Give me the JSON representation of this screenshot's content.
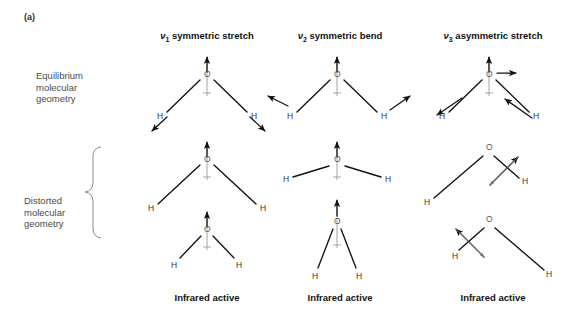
{
  "figure": {
    "panel_label": "(a)",
    "background_color": "#ffffff",
    "ink_color": "#111111",
    "axis_color": "#9a9a9a",
    "label_color": "#4a4a4a"
  },
  "columns": [
    {
      "id": "v1",
      "header_nu": "ν",
      "header_sub": "1",
      "header_rest": " symmetric stretch",
      "caption": "Infrared active",
      "center_x": 207
    },
    {
      "id": "v2",
      "header_nu": "ν",
      "header_sub": "2",
      "header_rest": " symmetric bend",
      "caption": "Infrared active",
      "center_x": 337
    },
    {
      "id": "v3",
      "header_nu": "ν",
      "header_sub": "3",
      "header_rest": " asymmetric stretch",
      "caption": "Infrared active",
      "center_x": 489
    }
  ],
  "row_labels": {
    "equilibrium": [
      "Equilibrium",
      "molecular",
      "geometry"
    ],
    "distorted": [
      "Distorted",
      "molecular",
      "geometry"
    ]
  },
  "atoms": {
    "oxygen": "O",
    "hydrogen": "H"
  },
  "diagram_data": {
    "type": "diagram",
    "subject": "Normal vibrational modes of the water molecule (H2O)",
    "rows": [
      "equilibrium molecular geometry",
      "distorted molecular geometry (extreme 1)",
      "distorted molecular geometry (extreme 2)"
    ],
    "modes": [
      {
        "label": "v1 symmetric stretch",
        "equilibrium_arrows": "O moves up along the C2 symmetry axis; both H atoms move outward and downward along their bonds",
        "distortion_1": "both O-H bonds stretched (long bonds, wide molecule)",
        "distortion_2": "both O-H bonds compressed (short bonds, small molecule)",
        "ir_activity": "Infrared active"
      },
      {
        "label": "v2 symmetric bend",
        "equilibrium_arrows": "O moves up along the symmetry axis; both H atoms move upward and outward perpendicular to the bonds",
        "distortion_1": "H-O-H bond angle opened wide (flattened molecule)",
        "distortion_2": "H-O-H bond angle closed narrow (pinched molecule)",
        "ir_activity": "Infrared active"
      },
      {
        "label": "v3 asymmetric stretch",
        "equilibrium_arrows": "O moves to the right horizontally; both H atoms move to the left, one along its bond and one toward the O",
        "distortion_1": "left O-H bond stretched long, right O-H bond compressed short with a double-headed arrow across it",
        "distortion_2": "right O-H bond stretched long, left O-H bond compressed short with a double-headed arrow across it",
        "ir_activity": "Infrared active"
      }
    ]
  }
}
